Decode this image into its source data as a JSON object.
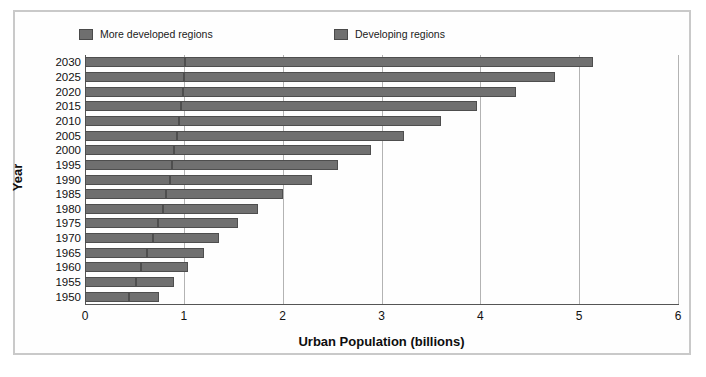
{
  "figure": {
    "border_color": "#c9c9c9",
    "background": "#ffffff"
  },
  "legend": {
    "position": "top",
    "items": [
      {
        "label": "More developed regions",
        "color": "#6f6f6f",
        "icon": "legend-swatch-icon"
      },
      {
        "label": "Developing regions",
        "color": "#707070",
        "icon": "legend-swatch-icon"
      }
    ]
  },
  "axes": {
    "xlabel": "Urban Population (billions)",
    "ylabel": "Year",
    "xticks": [
      "0",
      "1",
      "2",
      "3",
      "4",
      "5",
      "6"
    ],
    "xlim": [
      0,
      6
    ],
    "grid": "vertical"
  },
  "chart_data": {
    "type": "bar",
    "orientation": "horizontal",
    "stacked": true,
    "title": "",
    "xlabel": "Urban Population (billions)",
    "ylabel": "Year",
    "xlim": [
      0,
      6
    ],
    "xticks": [
      0,
      1,
      2,
      3,
      4,
      5,
      6
    ],
    "grid": true,
    "legend_position": "top",
    "categories": [
      "2030",
      "2025",
      "2020",
      "2015",
      "2010",
      "2005",
      "2000",
      "1995",
      "1990",
      "1985",
      "1980",
      "1975",
      "1970",
      "1965",
      "1960",
      "1955",
      "1950"
    ],
    "series": [
      {
        "name": "More developed regions",
        "color": "#6f6f6f",
        "values": [
          1.01,
          1.0,
          0.99,
          0.97,
          0.95,
          0.93,
          0.9,
          0.88,
          0.86,
          0.82,
          0.79,
          0.74,
          0.69,
          0.63,
          0.57,
          0.52,
          0.45
        ]
      },
      {
        "name": "Developing regions",
        "color": "#707070",
        "values": [
          4.13,
          3.76,
          3.37,
          3.0,
          2.65,
          2.3,
          1.99,
          1.68,
          1.44,
          1.18,
          0.96,
          0.81,
          0.67,
          0.57,
          0.47,
          0.38,
          0.3
        ]
      }
    ],
    "totals": [
      5.14,
      4.76,
      4.36,
      3.97,
      3.6,
      3.23,
      2.89,
      2.56,
      2.3,
      2.0,
      1.75,
      1.55,
      1.36,
      1.2,
      1.04,
      0.9,
      0.75
    ]
  }
}
